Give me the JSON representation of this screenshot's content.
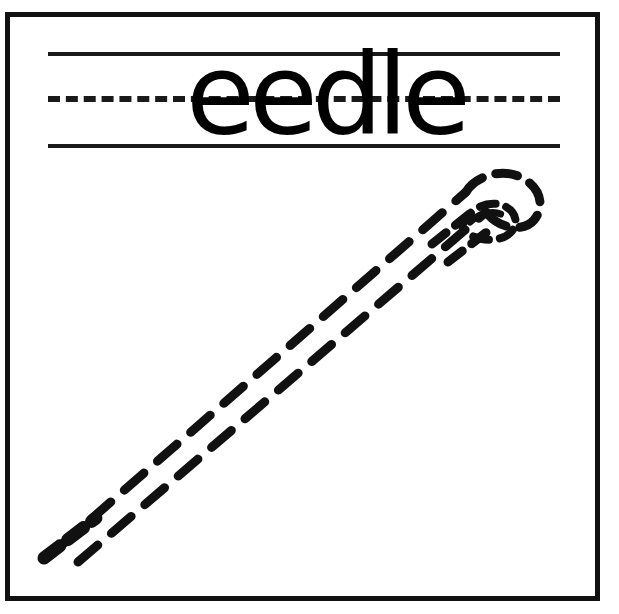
{
  "worksheet": {
    "title": "eedle",
    "word": "eedle",
    "letters": [
      "e",
      "e",
      "d",
      "l",
      "e"
    ],
    "full_word_hint": "needle",
    "ink_color": "#000000",
    "paper_color": "#ffffff",
    "frame": {
      "name": "page-border",
      "stroke_color": "#111111",
      "stroke_width": 5
    },
    "guide_lines": [
      {
        "name": "top-solid-line",
        "style": "solid",
        "y": 52
      },
      {
        "name": "middle-dashed-line",
        "style": "dashed",
        "y": 96
      },
      {
        "name": "bottom-solid-line",
        "style": "solid",
        "y": 144
      }
    ],
    "illustration": {
      "name": "sewing-needle",
      "style": "dashed-outline-tracing",
      "description": "Sewing needle drawn as a dashed outline running from lower-left point to upper-right eye",
      "orientation": "diagonal",
      "point_position": {
        "x": 46,
        "y": 556
      },
      "eye_position": {
        "x": 505,
        "y": 205
      },
      "stroke_color": "#111111"
    }
  }
}
